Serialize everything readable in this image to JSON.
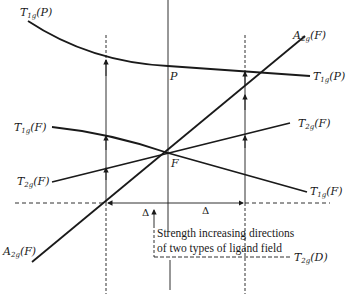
{
  "diagram": {
    "type": "energy-level correlation diagram",
    "labels": {
      "t1g_p_left": {
        "term": "T",
        "sub": "1g",
        "state": "(P)"
      },
      "t1g_p_right": {
        "term": "T",
        "sub": "1g",
        "state": "(P)"
      },
      "a2g_f_top": {
        "term": "A",
        "sub": "2g",
        "state": "(F)"
      },
      "a2g_f_bottom": {
        "term": "A",
        "sub": "2g",
        "state": "(F)"
      },
      "t1g_f_left": {
        "term": "T",
        "sub": "1g",
        "state": "(F)"
      },
      "t1g_f_right": {
        "term": "T",
        "sub": "1g",
        "state": "(F)"
      },
      "t2g_f_left": {
        "term": "T",
        "sub": "2g",
        "state": "(F)"
      },
      "t2g_f_right": {
        "term": "T",
        "sub": "2g",
        "state": "(F)"
      },
      "t2g_d": {
        "term": "T",
        "sub": "2g",
        "state": "(D)"
      },
      "point_p": "P",
      "point_f": "F",
      "delta_left": "Δ",
      "delta_right": "Δ"
    },
    "caption_line1": "Strength increasing directions",
    "caption_line2": "of two types of ligand field",
    "colors": {
      "ink": "#1a1a1a",
      "background": "#ffffff"
    }
  }
}
